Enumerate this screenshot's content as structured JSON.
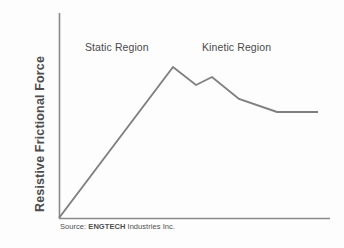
{
  "figure": {
    "axes": {
      "y_label": "Resistive Frictional Force",
      "x_label": ""
    },
    "annotations": {
      "static_region": "Static Region",
      "kinetic_region": "Kinetic Region"
    },
    "source": {
      "prefix": "Source:",
      "org": "ENGTECH",
      "suffix": "Industries Inc."
    },
    "colors": {
      "axis": "#8a8a8a",
      "curve": "#7f7f7f",
      "text": "#4a4a4a",
      "background": "#fdfdfd"
    }
  },
  "chart_data": {
    "type": "line",
    "title": "",
    "xlabel": "",
    "ylabel": "Resistive Frictional Force",
    "xlim": [
      0,
      100
    ],
    "ylim": [
      0,
      100
    ],
    "grid": false,
    "legend": null,
    "axis_ticks": {
      "x": [],
      "y": []
    },
    "series": [
      {
        "name": "Resistive Frictional Force",
        "x": [
          0,
          42,
          51,
          57,
          67,
          81,
          96
        ],
        "y": [
          0,
          100,
          88,
          94,
          71,
          71,
          71
        ],
        "points_px": [
          [
            59,
            218
          ],
          [
            173,
            67
          ],
          [
            196,
            85
          ],
          [
            212,
            77
          ],
          [
            239,
            99
          ],
          [
            277,
            112
          ],
          [
            318,
            112
          ]
        ]
      }
    ],
    "annotations": [
      {
        "text": "Static Region",
        "x_px": 85,
        "y_px": 41
      },
      {
        "text": "Kinetic Region",
        "x_px": 202,
        "y_px": 41
      }
    ]
  }
}
